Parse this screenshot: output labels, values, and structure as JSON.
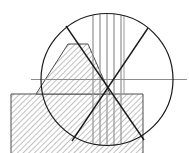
{
  "figure": {
    "canvas": {
      "width": 189,
      "height": 153,
      "background": "#ffffff"
    },
    "colors": {
      "outline": "#1a1a1a",
      "chord": "#1a1a1a",
      "axis_gray": "#8c8c8c",
      "ruling_gray": "#9a9a9a",
      "hatch": "#4d4d4d",
      "hatch_fill": "#ffffff",
      "background": "#ffffff"
    }
  },
  "chart_data": {
    "type": "diagram",
    "xlabel": "",
    "ylabel": "",
    "grid": false,
    "legend": null,
    "xlim": [
      0,
      189
    ],
    "ylim": [
      0,
      153
    ],
    "circle": {
      "name": "main-circle",
      "center_x": 107,
      "center_y": 79.5,
      "radius": 66,
      "stroke": "#1a1a1a",
      "stroke_width": 1.2,
      "fill": "none"
    },
    "axis_line": {
      "name": "horizontal-axis",
      "x1": 31,
      "y1": 79.5,
      "x2": 187,
      "y2": 79.5,
      "stroke": "#8c8c8c",
      "stroke_width": 1
    },
    "chords": [
      {
        "name": "chord-upper-left-to-lower-right",
        "x1": 66,
        "y1": 26,
        "x2": 144,
        "y2": 140,
        "stroke": "#1a1a1a",
        "stroke_width": 1.4
      },
      {
        "name": "chord-upper-right-to-lower-left",
        "x1": 148,
        "y1": 28,
        "x2": 72,
        "y2": 141,
        "stroke": "#1a1a1a",
        "stroke_width": 1.4
      }
    ],
    "vertical_rulings": {
      "name": "vertical-ruling-lines",
      "x_values": [
        93,
        100,
        107,
        114,
        121
      ],
      "y_top": 16,
      "y_bottom": 146,
      "stroke": "#9a9a9a",
      "stroke_width": 1.3,
      "count": 5
    },
    "vertical_boundary_line": {
      "name": "right-vertical-boundary",
      "x": 124,
      "y1": 16,
      "y2": 95,
      "stroke": "#9a9a9a",
      "stroke_width": 1
    },
    "ground": {
      "name": "hatched-ground",
      "top_y": 94,
      "left_x": 11,
      "right_x": 143,
      "bottom_y": 153,
      "hatch_angle_deg": 45,
      "hatch_spacing": 4,
      "stroke": "#4d4d4d"
    },
    "mound": {
      "name": "trapezoidal-mound",
      "top_left_x": 68,
      "top_right_x": 88,
      "top_y": 44,
      "base_left_x": 36,
      "base_right_x": 110,
      "base_y": 94,
      "hatch_angle_deg": 45,
      "hatch_spacing": 4,
      "stroke": "#4d4d4d"
    },
    "values": [],
    "categories": [],
    "annotations": []
  }
}
